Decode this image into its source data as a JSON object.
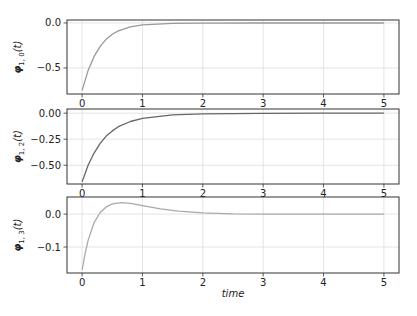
{
  "chart_data": [
    {
      "type": "line",
      "ylabel": "φ1,0(t)",
      "ylabel_main": "φ",
      "ylabel_sub": "1, 0",
      "ylabel_tail": "(t)",
      "xlabel": "",
      "xlim": [
        -0.25,
        5.25
      ],
      "ylim": [
        -0.79,
        0.033
      ],
      "xticks": [
        0,
        1,
        2,
        3,
        4,
        5
      ],
      "xtick_labels": [
        "0",
        "1",
        "2",
        "3",
        "4",
        "5"
      ],
      "yticks": [
        0.0,
        -0.5
      ],
      "ytick_labels": [
        "0.0",
        "−0.5"
      ],
      "grid": true,
      "line_color": "#999999",
      "series": [
        {
          "name": "phi_1_0",
          "x": [
            0,
            0.1,
            0.2,
            0.3,
            0.4,
            0.5,
            0.6,
            0.8,
            1.0,
            1.5,
            2.0,
            3.0,
            4.0,
            5.0
          ],
          "y": [
            -0.75,
            -0.53,
            -0.37,
            -0.26,
            -0.18,
            -0.125,
            -0.088,
            -0.043,
            -0.021,
            -0.004,
            -0.001,
            0.0,
            0.0,
            0.0
          ]
        }
      ]
    },
    {
      "type": "line",
      "ylabel": "φ1,2(t)",
      "ylabel_main": "φ",
      "ylabel_sub": "1, 2",
      "ylabel_tail": "(t)",
      "xlabel": "",
      "xlim": [
        -0.25,
        5.25
      ],
      "ylim": [
        -0.68,
        0.04
      ],
      "xticks": [
        0,
        1,
        2,
        3,
        4,
        5
      ],
      "xtick_labels": [
        "0",
        "1",
        "2",
        "3",
        "4",
        "5"
      ],
      "yticks": [
        0.0,
        -0.25,
        -0.5
      ],
      "ytick_labels": [
        "0.00",
        "−0.25",
        "−0.50"
      ],
      "grid": true,
      "line_color": "#666666",
      "series": [
        {
          "name": "phi_1_2",
          "x": [
            0,
            0.1,
            0.2,
            0.3,
            0.4,
            0.5,
            0.6,
            0.8,
            1.0,
            1.5,
            2.0,
            3.0,
            4.0,
            5.0
          ],
          "y": [
            -0.66,
            -0.5,
            -0.38,
            -0.29,
            -0.22,
            -0.17,
            -0.13,
            -0.08,
            -0.05,
            -0.016,
            -0.006,
            -0.001,
            0.0,
            0.0
          ]
        }
      ]
    },
    {
      "type": "line",
      "ylabel": "φ1,3(t)",
      "ylabel_main": "φ",
      "ylabel_sub": "1, 3",
      "ylabel_tail": "(t)",
      "xlabel": "time",
      "xlim": [
        -0.25,
        5.25
      ],
      "ylim": [
        -0.179,
        0.052
      ],
      "xticks": [
        0,
        1,
        2,
        3,
        4,
        5
      ],
      "xtick_labels": [
        "0",
        "1",
        "2",
        "3",
        "4",
        "5"
      ],
      "yticks": [
        0.0,
        -0.1
      ],
      "ytick_labels": [
        "0.0",
        "−0.1"
      ],
      "grid": true,
      "line_color": "#aaaaaa",
      "series": [
        {
          "name": "phi_1_3",
          "x": [
            0,
            0.05,
            0.1,
            0.2,
            0.3,
            0.4,
            0.5,
            0.65,
            0.8,
            1.0,
            1.3,
            1.6,
            2.0,
            2.5,
            3.0,
            4.0,
            5.0
          ],
          "y": [
            -0.17,
            -0.12,
            -0.08,
            -0.025,
            0.005,
            0.022,
            0.031,
            0.035,
            0.033,
            0.026,
            0.016,
            0.009,
            0.004,
            0.001,
            0.0,
            0.0,
            0.0
          ]
        }
      ]
    }
  ],
  "figure": {
    "axes_color": "#333333",
    "grid_color": "#dddddd"
  }
}
